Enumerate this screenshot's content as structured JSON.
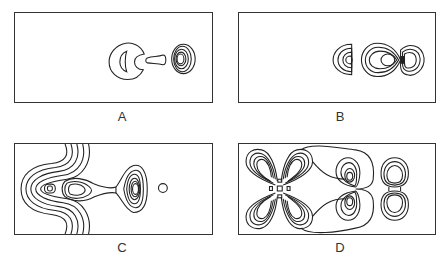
{
  "figure": {
    "panels": [
      {
        "id": "A",
        "label": "A",
        "description": "contour map: crescent-shaped contour with inner arc, small dumbbell-shaped contour, nested ellipses on right"
      },
      {
        "id": "B",
        "label": "B",
        "description": "contour map: three groups of nested lobes aligned horizontally on right side"
      },
      {
        "id": "C",
        "label": "C",
        "description": "contour map: wave-like nested contours wrapping left center, teardrop lobe, triangular nested lobe, isolated small circle"
      },
      {
        "id": "D",
        "label": "D",
        "description": "contour map: four-lobed cloverleaf nested contours, two stacked lobes with enveloping contour, figure-eight nested contours on right"
      }
    ]
  },
  "colors": {
    "line": "#222222",
    "frame": "#333333",
    "background": "#ffffff"
  }
}
